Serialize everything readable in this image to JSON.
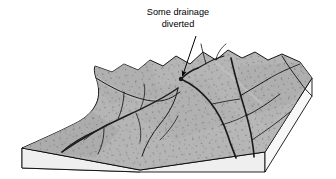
{
  "figure": {
    "type": "geologic-block-diagram",
    "background_color": "#ffffff"
  },
  "annotation": {
    "name": "drainage-diverted-label",
    "line1": "Some drainage",
    "line2": "diverted",
    "leader": {
      "from_x": 196,
      "from_y": 36,
      "to_x": 181,
      "to_y": 79,
      "arrowhead": "filled-triangle"
    }
  },
  "colors": {
    "surface_gray": "#b5b5b5",
    "surface_gray_shaded": "#a8a8a8",
    "side_face_light": "#efefef",
    "side_face_right": "#f7f7f7",
    "outline": "#000000",
    "drainage_line": "#1a1a1a",
    "stipple": "#555555"
  },
  "block": {
    "name": "terrain-block",
    "top_surface_label": "stippled upland surface",
    "front_face_label": "block front cut face",
    "right_face_label": "block right cut face",
    "corners": {
      "front_left": [
        22,
        148
      ],
      "front_mid": [
        140,
        170
      ],
      "front_right": [
        265,
        152
      ],
      "right_corner": [
        312,
        78
      ],
      "back_right": [
        300,
        62
      ],
      "back_left": [
        95,
        66
      ]
    }
  },
  "drainage": {
    "name": "dendritic-drainage-network",
    "description": "Dendritic stream channels incised into the upland surface, with one channel diverted at the ridge crest",
    "channel_count": 14
  }
}
